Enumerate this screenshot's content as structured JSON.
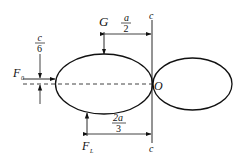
{
  "diagram": {
    "type": "mechanics free-body diagram",
    "colors": {
      "stroke": "#111111",
      "background": "#ffffff"
    },
    "labels": {
      "G": "G",
      "F0": "F",
      "F0_sub": "0",
      "FL": "F",
      "FL_sub": "L",
      "O": "O",
      "c_top": "c",
      "c_bottom": "c"
    },
    "dimensions": {
      "a_half": {
        "num": "a",
        "den": "2"
      },
      "c_sixth": {
        "num": "c",
        "den": "6"
      },
      "two_a_third": {
        "num": "2a",
        "den": "3"
      }
    }
  }
}
